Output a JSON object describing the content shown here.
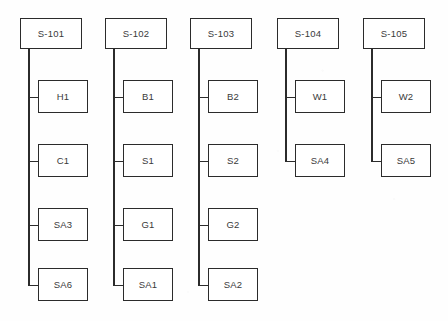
{
  "diagram": {
    "type": "tree",
    "orientation": "top-down",
    "box_fill": "#ffffff",
    "line_color": "#2b2b2b",
    "text_color": "#3a3a3a",
    "background": "#fefefe",
    "columns": [
      {
        "id": "col-1",
        "root": {
          "label": "S-101"
        },
        "children": [
          {
            "label": "H1"
          },
          {
            "label": "C1"
          },
          {
            "label": "SA3"
          },
          {
            "label": "SA6"
          }
        ]
      },
      {
        "id": "col-2",
        "root": {
          "label": "S-102"
        },
        "children": [
          {
            "label": "B1"
          },
          {
            "label": "S1"
          },
          {
            "label": "G1"
          },
          {
            "label": "SA1"
          }
        ]
      },
      {
        "id": "col-3",
        "root": {
          "label": "S-103"
        },
        "children": [
          {
            "label": "B2"
          },
          {
            "label": "S2"
          },
          {
            "label": "G2"
          },
          {
            "label": "SA2"
          }
        ]
      },
      {
        "id": "col-4",
        "root": {
          "label": "S-104"
        },
        "children": [
          {
            "label": "W1"
          },
          {
            "label": "SA4"
          }
        ]
      },
      {
        "id": "col-5",
        "root": {
          "label": "S-105"
        },
        "children": [
          {
            "label": "W2"
          },
          {
            "label": "SA5"
          }
        ]
      }
    ]
  }
}
